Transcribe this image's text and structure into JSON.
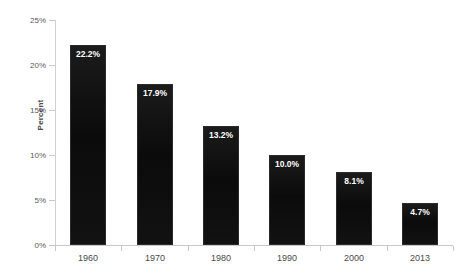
{
  "chart_data": {
    "type": "bar",
    "title": "",
    "subtitle": "",
    "xlabel": "",
    "ylabel": "Percent",
    "categories": [
      "1960",
      "1970",
      "1980",
      "1990",
      "2000",
      "2013"
    ],
    "values": [
      22.2,
      17.9,
      13.2,
      10.0,
      8.1,
      4.7
    ],
    "value_labels": [
      "22.2%",
      "17.9%",
      "13.2%",
      "10.0%",
      "8.1%",
      "4.7%"
    ],
    "ylim": [
      0,
      25
    ],
    "ytick_values": [
      0,
      5,
      10,
      15,
      20,
      25
    ],
    "ytick_labels": [
      "0%",
      "5%",
      "10%",
      "15%",
      "20%",
      "25%"
    ],
    "grid": false,
    "legend": null,
    "legend_position": "none",
    "bar_color": "#101010",
    "label_color": "#ffffff",
    "axis_color": "#c8c8c8",
    "tick_text_color": "#5a5a5a",
    "background_color": "#ffffff"
  }
}
